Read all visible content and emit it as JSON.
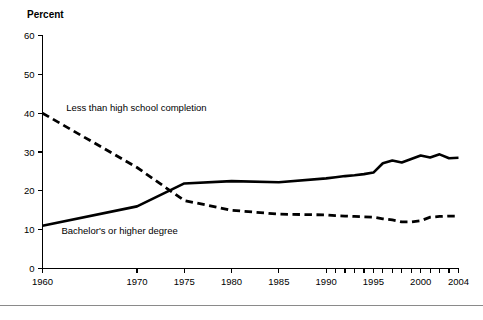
{
  "chart_data": {
    "type": "line",
    "title": "",
    "subtitle": "",
    "xlabel": "",
    "ylabel": "Percent",
    "ylim": [
      0,
      60
    ],
    "xlim": [
      1960,
      2004
    ],
    "grid": false,
    "legend_position": "inline-annotation",
    "yticks": [
      0,
      10,
      20,
      30,
      40,
      50,
      60
    ],
    "ytick_labels": [
      "0",
      "10",
      "20",
      "30",
      "40",
      "50",
      "60"
    ],
    "xticks": [
      1960,
      1970,
      1975,
      1980,
      1985,
      1990,
      1991,
      1992,
      1993,
      1994,
      1995,
      1996,
      1997,
      1998,
      1999,
      2000,
      2001,
      2002,
      2003,
      2004
    ],
    "xtick_labels_shown": [
      "1960",
      "1970",
      "1975",
      "1980",
      "1985",
      "1990",
      "1995",
      "2000",
      "2004"
    ],
    "xtick_labeled_values": [
      1960,
      1970,
      1975,
      1980,
      1985,
      1990,
      1995,
      2000,
      2004
    ],
    "annotations": [
      {
        "text": "Less than high school completion",
        "x": 1962.5,
        "y": 40.5
      },
      {
        "text": "Bachelor's or higher degree",
        "x": 1962.0,
        "y": 9.0
      }
    ],
    "series": [
      {
        "name": "Less than high school completion",
        "style": "dashed",
        "x": [
          1960,
          1970,
          1975,
          1980,
          1985,
          1990,
          1991,
          1992,
          1993,
          1994,
          1995,
          1996,
          1997,
          1998,
          1999,
          2000,
          2001,
          2002,
          2003,
          2004
        ],
        "values": [
          40.0,
          26.0,
          17.5,
          15.0,
          14.0,
          13.8,
          13.6,
          13.5,
          13.4,
          13.3,
          13.2,
          12.8,
          12.5,
          12.0,
          12.0,
          12.3,
          13.2,
          13.4,
          13.5,
          13.5
        ]
      },
      {
        "name": "Bachelor's or higher degree",
        "style": "solid",
        "x": [
          1960,
          1970,
          1975,
          1980,
          1985,
          1990,
          1991,
          1992,
          1993,
          1994,
          1995,
          1996,
          1997,
          1998,
          1999,
          2000,
          2001,
          2002,
          2003,
          2004
        ],
        "values": [
          11.0,
          16.0,
          21.9,
          22.5,
          22.2,
          23.2,
          23.5,
          23.8,
          24.0,
          24.3,
          24.7,
          27.1,
          27.8,
          27.3,
          28.2,
          29.1,
          28.6,
          29.4,
          28.4,
          28.5
        ]
      }
    ]
  },
  "axis": {
    "y_title": "Percent"
  }
}
